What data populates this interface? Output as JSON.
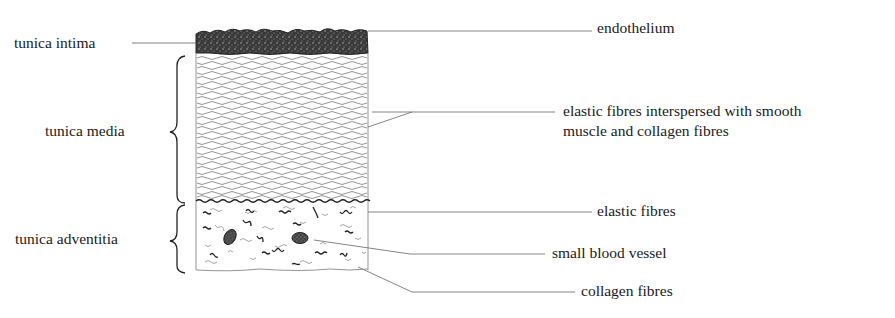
{
  "diagram": {
    "layers": [
      {
        "name": "tunica intima"
      },
      {
        "name": "tunica media"
      },
      {
        "name": "tunica adventitia"
      }
    ],
    "callouts": [
      {
        "text": "endothelium"
      },
      {
        "text_line1": "elastic fibres interspersed with smooth",
        "text_line2": "muscle and collagen fibres"
      },
      {
        "text": "elastic fibres"
      },
      {
        "text": "small blood vessel"
      },
      {
        "text": "collagen fibres"
      }
    ],
    "colors": {
      "ink": "#1a1a1a",
      "line": "#555555",
      "fibre": "#777777",
      "background": "#ffffff"
    }
  }
}
